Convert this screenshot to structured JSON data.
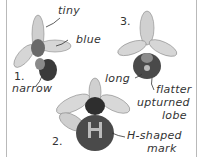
{
  "illustration": {
    "subject": "orchid flowers",
    "flowers": [
      {
        "number": "1.",
        "labels": [
          "tiny",
          "blue",
          "narrow"
        ]
      },
      {
        "number": "2.",
        "labels": [
          "H-shaped",
          "mark"
        ]
      },
      {
        "number": "3.",
        "labels": [
          "long",
          "flatter",
          "upturned",
          "lobe"
        ]
      }
    ]
  },
  "labels": {
    "tiny": "tiny",
    "blue": "blue",
    "narrow": "narrow",
    "long": "long",
    "flatter": "flatter",
    "upturned": "upturned",
    "lobe": "lobe",
    "h_shaped": "H-shaped",
    "mark": "mark"
  },
  "numbers": {
    "one": "1.",
    "two": "2.",
    "three": "3."
  },
  "colors": {
    "ink": "#333333",
    "border": "#b9b9b9",
    "petal": "#bdbdbd",
    "lip": "#3a3a3a"
  }
}
